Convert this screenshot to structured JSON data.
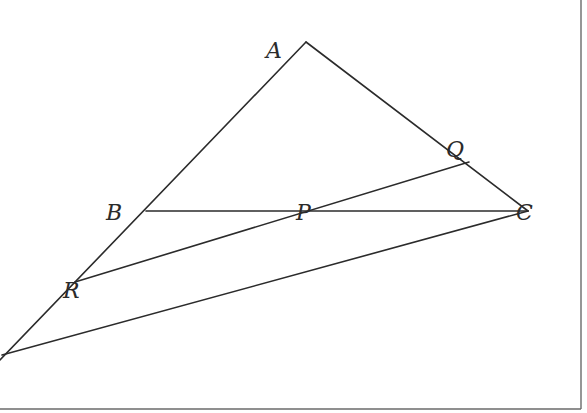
{
  "diagram": {
    "type": "geometry-figure",
    "points": {
      "A": {
        "label": "A",
        "x": 306,
        "y": 42,
        "label_x": 266,
        "label_y": 58
      },
      "B": {
        "label": "B",
        "x": 146,
        "y": 211,
        "label_x": 106,
        "label_y": 220
      },
      "C": {
        "label": "C",
        "x": 528,
        "y": 211,
        "label_x": 518,
        "label_y": 220
      },
      "P": {
        "label": "P",
        "x": 306,
        "y": 211,
        "label_x": 296,
        "label_y": 220
      },
      "Q": {
        "label": "Q",
        "x": 469,
        "y": 162,
        "label_x": 446,
        "label_y": 157
      },
      "R": {
        "label": "R",
        "x": 75,
        "y": 282,
        "label_x": 63,
        "label_y": 298
      },
      "O": {
        "label": "",
        "x": 5,
        "y": 354
      }
    },
    "segments": [
      {
        "from": "O",
        "to": "A",
        "name": "line-OA"
      },
      {
        "from": "A",
        "to": "C",
        "name": "line-AC"
      },
      {
        "from": "B",
        "to": "C",
        "name": "line-BC"
      },
      {
        "from": "R",
        "to": "Q",
        "name": "line-RQ"
      },
      {
        "from": "O",
        "to": "C",
        "name": "line-OC"
      }
    ],
    "labels": [
      "A",
      "B",
      "C",
      "P",
      "Q",
      "R"
    ]
  }
}
